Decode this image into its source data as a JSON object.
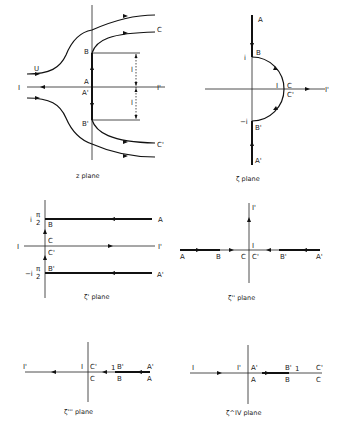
{
  "panels": {
    "z": {
      "caption": "z plane",
      "labels": {
        "U": "U",
        "I": "I",
        "I_prime": "I'",
        "A": "A",
        "A_prime": "A'",
        "B": "B",
        "B_prime": "B'",
        "C": "C",
        "C_prime": "C'",
        "l_top": "l",
        "l_bottom": "l"
      }
    },
    "zeta": {
      "caption": "ζ  plane",
      "labels": {
        "A": "A",
        "A_prime": "A'",
        "B": "B",
        "B_prime": "B'",
        "i": "i",
        "minus_i": "−i",
        "I": "I",
        "C": "C",
        "C_prime": "C'",
        "I_prime": "I'"
      }
    },
    "zeta1": {
      "caption": "ζ'  plane",
      "labels": {
        "i_pi_2": "i",
        "minus_i_pi_2": "−i",
        "pi": "π",
        "two": "2",
        "pi_b": "π",
        "two_b": "2",
        "B": "B",
        "C": "C",
        "C_prime": "C'",
        "B_prime": "B'",
        "I": "I",
        "I_prime": "I'",
        "A": "A",
        "A_prime": "A'"
      }
    },
    "zeta2": {
      "caption": "ζ''  plane",
      "labels": {
        "I_prime": "I'",
        "I": "I",
        "A": "A",
        "B": "B",
        "C": "C",
        "C_prime": "C'",
        "B_prime": "B'",
        "A_prime": "A'"
      }
    },
    "zeta3": {
      "caption": "ζ'''  plane",
      "labels": {
        "I_prime": "I'",
        "I": "I",
        "C_prime": "C'",
        "C": "C",
        "one": "1",
        "B_prime": "B'",
        "B": "B",
        "A_prime": "A'",
        "A": "A"
      }
    },
    "zeta4": {
      "caption": "ζ^IV  plane",
      "labels": {
        "I": "I",
        "I_prime": "I'",
        "A_prime": "A'",
        "A": "A",
        "B_prime": "B'",
        "B": "B",
        "one": "1",
        "C_prime": "C'",
        "C": "C"
      }
    }
  }
}
